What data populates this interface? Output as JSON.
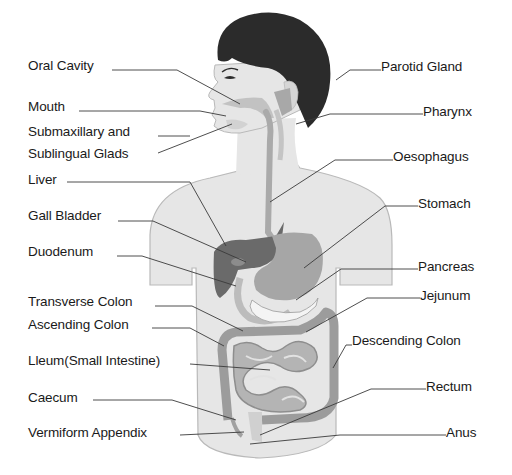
{
  "diagram": {
    "colors": {
      "skin": "#e6e6e6",
      "skin_outline": "#b9b9b9",
      "hair": "#2b2b2b",
      "organ_mid": "#a8a8a8",
      "organ_dark": "#5f5f5f",
      "intestine": "#9c9c9c",
      "leader_line": "#3a3a3a",
      "text": "#1a1a1a"
    },
    "labels_left": [
      {
        "text": "Oral  Cavity",
        "x": 28,
        "y": 58
      },
      {
        "text": "Mouth",
        "x": 28,
        "y": 99
      },
      {
        "text": "Submaxillary and",
        "x": 28,
        "y": 124
      },
      {
        "text": "Sublingual Glads",
        "x": 28,
        "y": 146
      },
      {
        "text": "Liver",
        "x": 28,
        "y": 172
      },
      {
        "text": "Gall Bladder",
        "x": 28,
        "y": 208
      },
      {
        "text": "Duodenum",
        "x": 28,
        "y": 244
      },
      {
        "text": "Transverse Colon",
        "x": 28,
        "y": 294
      },
      {
        "text": "Ascending Colon",
        "x": 28,
        "y": 317
      },
      {
        "text": "Lleum(Small Intestine)",
        "x": 28,
        "y": 353
      },
      {
        "text": "Caecum",
        "x": 28,
        "y": 390
      },
      {
        "text": "Vermiform Appendix",
        "x": 28,
        "y": 425
      }
    ],
    "labels_right": [
      {
        "text": "Parotid Gland",
        "x": 381,
        "y": 59
      },
      {
        "text": "Pharynx",
        "x": 423,
        "y": 104
      },
      {
        "text": "Oesophagus",
        "x": 393,
        "y": 149
      },
      {
        "text": "Stomach",
        "x": 418,
        "y": 196
      },
      {
        "text": "Pancreas",
        "x": 418,
        "y": 259
      },
      {
        "text": "Jejunum",
        "x": 420,
        "y": 288
      },
      {
        "text": "Descending Colon",
        "x": 352,
        "y": 333
      },
      {
        "text": "Rectum",
        "x": 426,
        "y": 379
      },
      {
        "text": "Anus",
        "x": 446,
        "y": 425
      }
    ]
  }
}
